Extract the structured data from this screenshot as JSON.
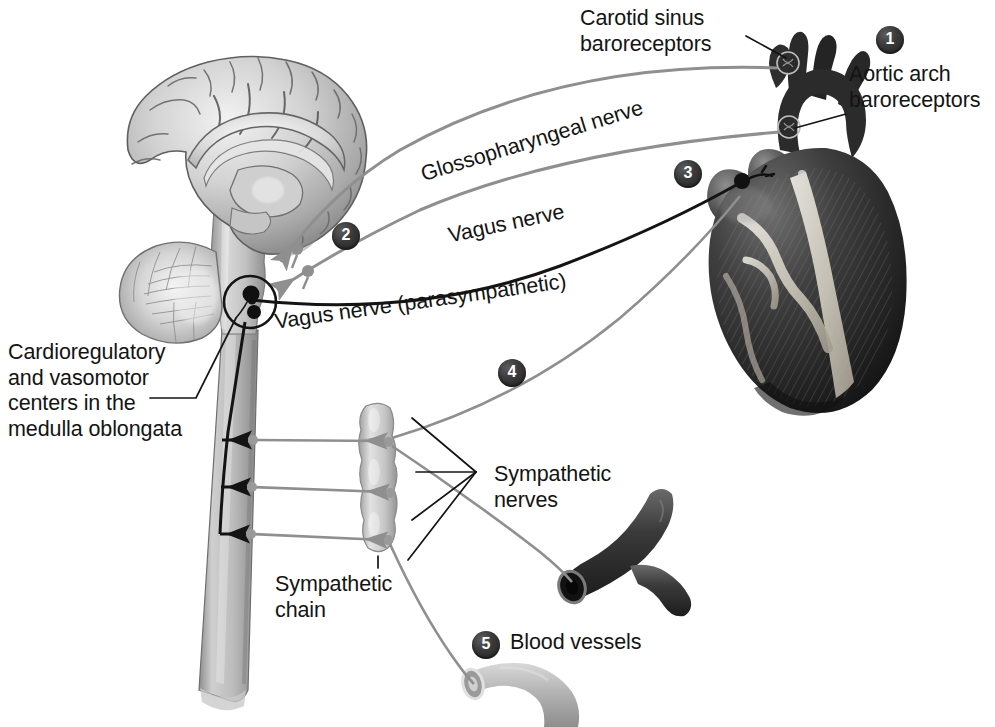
{
  "figure": {
    "background": "#ffffff",
    "width": 995,
    "height": 727
  },
  "labels": {
    "carotid_sinus": "Carotid sinus\nbaroreceptors",
    "aortic_arch": "Aortic arch\nbaroreceptors",
    "glossopharyngeal": "Glossopharyngeal nerve",
    "vagus": "Vagus nerve",
    "vagus_parasympathetic": "Vagus nerve (parasympathetic)",
    "medulla_centers": "Cardioregulatory\nand vasomotor\ncenters in the\nmedulla oblongata",
    "sympathetic_nerves": "Sympathetic\nnerves",
    "sympathetic_chain": "Sympathetic\nchain",
    "blood_vessels": "Blood vessels"
  },
  "badges": [
    {
      "number": "1",
      "x": 876,
      "y": 26,
      "target": "aortic-arch-and-carotid-baroreceptors"
    },
    {
      "number": "2",
      "x": 332,
      "y": 222,
      "target": "afferent-sensory-nerves"
    },
    {
      "number": "3",
      "x": 674,
      "y": 160,
      "target": "vagus-parasympathetic-to-heart"
    },
    {
      "number": "4",
      "x": 498,
      "y": 359,
      "target": "sympathetic-nerves-to-heart"
    },
    {
      "number": "5",
      "x": 472,
      "y": 631,
      "target": "blood-vessels"
    }
  ],
  "anatomy": {
    "brain": "midsagittal-brain-section",
    "cerebellum": "cerebellum",
    "brainstem": "brainstem-and-spinal-cord",
    "heart": "heart-anterior-view",
    "sympathetic_chain": "sympathetic-chain-ganglia",
    "artery": "artery-dark",
    "vein": "vein-light"
  },
  "colors": {
    "text": "#141414",
    "badge_fill": "#2b2b2b",
    "badge_text": "#ffffff",
    "nerve_gray": "#8f8f8f",
    "nerve_dark": "#1a1a1a",
    "leader_line": "#1a1a1a",
    "tissue_light": "#cfcfcf",
    "tissue_mid": "#a8a8a8",
    "tissue_dark": "#4a4a4a",
    "heart_dark": "#2e2e2e",
    "vessel_dark": "#3b3b3b",
    "vessel_light": "#b9b9b9"
  }
}
